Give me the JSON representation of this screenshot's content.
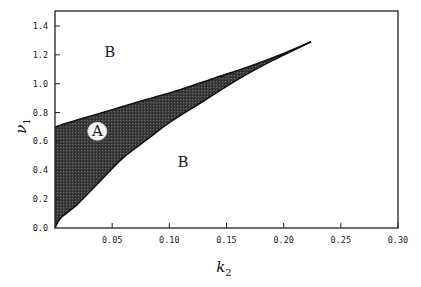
{
  "chart_data": {
    "type": "area",
    "title": "",
    "xlabel": "k",
    "xlabel_sub": "2",
    "ylabel": "ν",
    "ylabel_sub": "1",
    "xlim": [
      0.0,
      0.3
    ],
    "ylim": [
      0.0,
      1.5
    ],
    "xticks": [
      0.05,
      0.1,
      0.15,
      0.2,
      0.25,
      0.3
    ],
    "xtick_labels": [
      "0.05",
      "0.10",
      "0.15",
      "0.20",
      "0.25",
      "0.30"
    ],
    "yticks": [
      0.0,
      0.2,
      0.4,
      0.6,
      0.8,
      1.0,
      1.2,
      1.4
    ],
    "ytick_labels": [
      "0.0",
      "0.2",
      "0.4",
      "0.6",
      "0.8",
      "1.0",
      "1.2",
      "1.4"
    ],
    "grid": false,
    "legend": null,
    "series": [
      {
        "name": "upper boundary",
        "x": [
          0.0,
          0.02,
          0.05,
          0.08,
          0.11,
          0.14,
          0.17,
          0.2,
          0.224
        ],
        "y": [
          0.7,
          0.75,
          0.82,
          0.89,
          0.96,
          1.04,
          1.12,
          1.21,
          1.29
        ]
      },
      {
        "name": "lower boundary",
        "x": [
          0.0,
          0.005,
          0.019,
          0.04,
          0.06,
          0.08,
          0.1,
          0.13,
          0.16,
          0.19,
          0.224
        ],
        "y": [
          0.0,
          0.07,
          0.16,
          0.33,
          0.49,
          0.61,
          0.73,
          0.88,
          1.03,
          1.16,
          1.29
        ]
      }
    ],
    "regions": [
      {
        "label": "A",
        "description": "shaded region between boundaries",
        "label_pos": [
          0.037,
          0.67
        ],
        "circled": true
      },
      {
        "label": "B",
        "description": "above upper boundary",
        "label_pos": [
          0.048,
          1.22
        ]
      },
      {
        "label": "B",
        "description": "below lower boundary",
        "label_pos": [
          0.112,
          0.46
        ]
      }
    ],
    "fill_color": "#3a3a3a"
  }
}
